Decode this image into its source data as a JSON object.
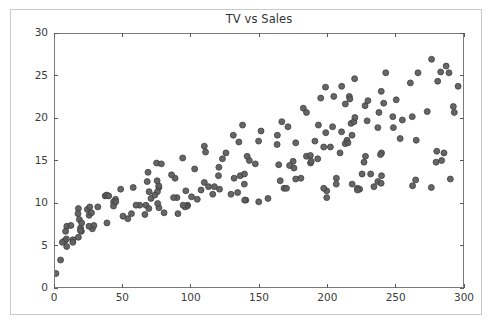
{
  "chart_data": {
    "type": "scatter",
    "title": "TV vs Sales",
    "xlabel": "",
    "ylabel": "",
    "xlim": [
      0,
      300
    ],
    "ylim": [
      0,
      30
    ],
    "xticks": [
      0,
      50,
      100,
      150,
      200,
      250,
      300
    ],
    "yticks": [
      0,
      5,
      10,
      15,
      20,
      25,
      30
    ],
    "grid": false,
    "legend": false,
    "marker": {
      "shape": "circle",
      "size_px": 6,
      "fill_color": "#5e5e5e",
      "edge_color": "#3f3f3f",
      "opacity": 0.95
    },
    "frame_color": "#7a7a7a",
    "background_color": "#ffffff",
    "point_count": 200,
    "x": [
      230.1,
      44.5,
      17.2,
      151.5,
      180.8,
      8.7,
      57.5,
      120.2,
      8.6,
      199.8,
      66.1,
      214.7,
      23.8,
      97.5,
      204.1,
      195.4,
      67.8,
      281.4,
      69.2,
      147.3,
      218.4,
      237.4,
      13.2,
      228.3,
      62.3,
      262.9,
      142.9,
      240.1,
      248.8,
      70.6,
      292.9,
      112.9,
      97.2,
      265.6,
      95.7,
      290.7,
      266.9,
      74.7,
      43.1,
      228.0,
      202.5,
      177.0,
      293.6,
      206.9,
      25.1,
      175.1,
      89.7,
      239.9,
      227.2,
      66.9,
      199.8,
      100.4,
      216.4,
      182.6,
      262.7,
      198.9,
      7.3,
      136.2,
      210.8,
      210.7,
      53.5,
      261.3,
      239.3,
      102.7,
      131.1,
      69.0,
      31.5,
      139.3,
      237.4,
      216.8,
      199.1,
      109.8,
      26.8,
      129.4,
      213.4,
      16.9,
      27.5,
      120.5,
      5.4,
      116.0,
      76.4,
      239.8,
      75.3,
      68.4,
      213.5,
      193.2,
      76.3,
      110.7,
      88.3,
      109.8,
      134.3,
      28.6,
      217.7,
      250.9,
      107.4,
      163.3,
      197.6,
      184.9,
      289.7,
      135.2,
      222.4,
      296.4,
      280.2,
      187.9,
      238.2,
      137.9,
      25.0,
      90.4,
      13.1,
      255.4,
      225.8,
      241.7,
      175.7,
      209.6,
      78.2,
      75.1,
      139.2,
      76.4,
      125.7,
      19.4,
      141.3,
      18.8,
      224.0,
      123.1,
      229.5,
      87.2,
      7.8,
      80.2,
      220.3,
      59.6,
      0.7,
      265.2,
      8.4,
      219.8,
      36.9,
      48.3,
      25.6,
      273.7,
      43.0,
      184.9,
      73.4,
      193.7,
      220.5,
      104.6,
      96.2,
      140.3,
      240.1,
      243.2,
      38.0,
      44.7,
      280.7,
      121.0,
      197.6,
      171.3,
      187.8,
      4.1,
      93.9,
      149.8,
      11.7,
      131.7,
      172.5,
      85.7,
      188.4,
      163.5,
      117.2,
      234.5,
      17.9,
      206.8,
      215.4,
      284.3,
      50.0,
      164.5,
      19.6,
      168.4,
      222.4,
      276.9,
      248.4,
      170.2,
      276.7,
      165.6,
      156.6,
      218.5,
      56.2,
      287.6,
      253.8,
      205.0,
      139.5,
      191.1,
      286.0,
      18.7,
      39.5,
      75.5,
      17.2,
      166.8,
      149.7,
      38.2,
      94.2,
      177.0,
      283.6,
      232.1
    ],
    "y": [
      22.1,
      10.4,
      9.3,
      18.5,
      12.9,
      7.2,
      11.8,
      13.2,
      4.8,
      10.6,
      8.6,
      17.4,
      9.2,
      9.7,
      19.0,
      22.4,
      12.5,
      24.4,
      11.3,
      14.6,
      18.0,
      12.5,
      5.6,
      15.5,
      9.7,
      12.0,
      15.0,
      15.9,
      18.9,
      10.5,
      21.4,
      11.9,
      9.6,
      17.4,
      9.5,
      12.8,
      25.4,
      14.7,
      10.1,
      21.5,
      16.6,
      17.1,
      20.7,
      12.9,
      8.5,
      14.9,
      10.6,
      23.2,
      14.8,
      9.7,
      11.4,
      10.7,
      22.6,
      21.2,
      20.2,
      23.7,
      5.5,
      13.2,
      23.8,
      18.4,
      8.1,
      24.2,
      15.7,
      14.0,
      18.0,
      9.3,
      9.5,
      13.4,
      18.9,
      22.3,
      18.3,
      12.4,
      8.8,
      11.0,
      17.0,
      8.7,
      6.9,
      14.2,
      5.3,
      11.0,
      11.8,
      12.3,
      11.3,
      13.6,
      21.7,
      15.2,
      12.0,
      16.0,
      12.9,
      16.7,
      11.2,
      7.3,
      19.4,
      22.2,
      11.5,
      16.9,
      11.7,
      15.5,
      25.4,
      17.2,
      11.7,
      23.8,
      14.8,
      14.7,
      20.7,
      19.2,
      7.2,
      8.7,
      5.3,
      19.8,
      13.4,
      21.8,
      14.1,
      15.9,
      14.6,
      12.6,
      12.2,
      9.4,
      15.9,
      6.6,
      15.5,
      7.0,
      11.6,
      15.2,
      19.7,
      10.6,
      6.6,
      8.8,
      24.7,
      9.7,
      1.6,
      12.7,
      5.7,
      19.6,
      10.8,
      11.6,
      9.5,
      20.8,
      9.6,
      20.7,
      10.9,
      19.2,
      20.1,
      10.4,
      11.4,
      10.3,
      13.2,
      25.4,
      10.9,
      10.1,
      16.1,
      11.6,
      16.6,
      19.0,
      15.6,
      3.2,
      15.3,
      10.1,
      7.3,
      12.9,
      14.4,
      13.3,
      14.9,
      18.0,
      11.9,
      11.9,
      8.0,
      12.2,
      17.1,
      15.0,
      8.4,
      14.5,
      7.6,
      11.7,
      11.5,
      27.0,
      20.2,
      11.7,
      11.8,
      12.6,
      10.5,
      12.2,
      8.7,
      26.2,
      17.6,
      22.6,
      10.3,
      17.3,
      15.9,
      6.7,
      10.8,
      9.9,
      5.9,
      19.6,
      17.3,
      7.6,
      9.7,
      12.8,
      25.5,
      13.4
    ]
  }
}
